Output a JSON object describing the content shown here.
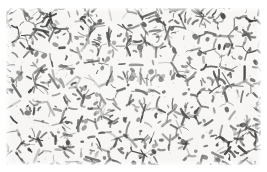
{
  "figure": {
    "kind": "metallographic-micrograph",
    "caption": "",
    "scale_bar": "",
    "magnification_label": ""
  },
  "image": {
    "width_px": 267,
    "height_px": 172,
    "field_left_px": 6,
    "field_top_px": 8,
    "field_width_px": 255,
    "field_height_px": 157,
    "border_color": "#ffffff",
    "background_color": "#f6f5f3",
    "grain_interior_color": "#f2f1ee",
    "boundary_dark_color": "#262626",
    "boundary_mid_color": "#5a5a5a",
    "boundary_light_color": "#9a9a9a",
    "grain_mean_diameter_px": 16,
    "grain_count_estimate": 240,
    "is_grayscale": true
  },
  "render": {
    "seed": 20240517,
    "cell_columns": 17,
    "cell_rows": 11,
    "jitter": 0.42,
    "boundary_width_min": 0.7,
    "boundary_width_max": 2.6,
    "blob_count": 170,
    "speckle_count": 260
  }
}
